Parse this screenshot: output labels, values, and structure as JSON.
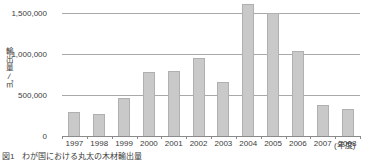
{
  "chart_data": {
    "type": "bar",
    "title": "",
    "xlabel": "(年度)",
    "ylabel": "輸出量／㎥",
    "ylim": [
      0,
      1700000
    ],
    "grid": true,
    "legend": null,
    "categories": [
      "1997",
      "1998",
      "1999",
      "2000",
      "2001",
      "2002",
      "2003",
      "2004",
      "2005",
      "2006",
      "2007",
      "2008"
    ],
    "values": [
      290000,
      265000,
      460000,
      775000,
      790000,
      950000,
      655000,
      1610000,
      1495000,
      1035000,
      375000,
      330000
    ],
    "ytick_values": [
      0,
      500000,
      1000000,
      1500000
    ],
    "ytick_labels": [
      "0",
      "500,000",
      "1,000,000",
      "1,500,000"
    ],
    "bar_color": "#c9c9c9",
    "bar_edge_color": "#b0b0b0",
    "grid_color": "#a9a9a9",
    "axis_color": "#8a8a8a",
    "text_color": "#3b3b3b"
  },
  "axes": {
    "y_title_chars": [
      "輸",
      "出",
      "量"
    ],
    "y_title_slash": "／",
    "y_title_unit": "㎥",
    "x_unit_label": "(年度)"
  },
  "caption": {
    "text": "図1　わが国における丸太の木材輸出量"
  }
}
